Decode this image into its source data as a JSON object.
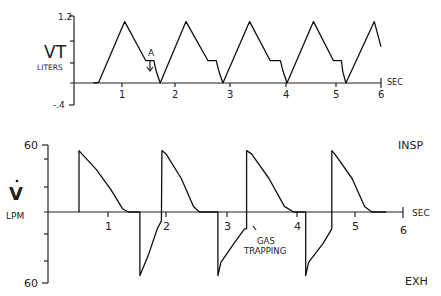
{
  "chart_data": [
    {
      "type": "line",
      "title": "",
      "ylabel_main": "VT",
      "ylabel_unit": "LITERS",
      "xlabel": "SEC",
      "xlim": [
        0,
        6
      ],
      "ylim": [
        -0.4,
        1.2
      ],
      "y_tick_labels": [
        "1.2",
        "-.4"
      ],
      "y_ticks": [
        1.2,
        0.8,
        0.4,
        0,
        -0.4
      ],
      "x_ticks": [
        1,
        2,
        3,
        4,
        5,
        6
      ],
      "x_tick_labels": [
        "1",
        "2",
        "3",
        "4",
        "5",
        "6"
      ],
      "grid": false,
      "annotations": [
        {
          "text": "A",
          "x": 1.55,
          "y": 0.35,
          "arrow": "down"
        }
      ],
      "series": [
        {
          "name": "Tidal volume",
          "x": [
            0.45,
            0.55,
            1.05,
            1.45,
            1.6,
            1.65,
            1.72,
            2.2,
            2.6,
            2.75,
            2.8,
            2.87,
            3.35,
            3.72,
            3.9,
            3.95,
            4.02,
            4.55,
            4.95,
            5.12,
            5.15,
            5.22,
            5.85,
            6.0
          ],
          "y": [
            0,
            0.01,
            1.1,
            0.4,
            0.4,
            0.2,
            0,
            1.1,
            0.4,
            0.4,
            0.2,
            0,
            1.1,
            0.4,
            0.4,
            0.2,
            0,
            1.1,
            0.4,
            0.4,
            0.2,
            0,
            1.1,
            0.65
          ]
        }
      ]
    },
    {
      "type": "line",
      "title": "",
      "ylabel_main": "V̇",
      "ylabel_unit": "LPM",
      "xlabel": "SEC",
      "xlim": [
        0,
        6
      ],
      "ylim": [
        -60,
        60
      ],
      "y_tick_labels": [
        "60",
        "60"
      ],
      "y_ticks": [
        60,
        40,
        20,
        0,
        -20,
        -40,
        -60
      ],
      "x_ticks": [
        1,
        2,
        3,
        4,
        5,
        6
      ],
      "x_tick_labels": [
        "1",
        "2",
        "3",
        "4",
        "5",
        "6"
      ],
      "grid": false,
      "right_labels": {
        "top": "INSP",
        "bottom": "EXH"
      },
      "annotations": [
        {
          "text": "GAS TRAPPING",
          "x": 3.3,
          "y": -12,
          "arrow": "up-left"
        }
      ],
      "series": [
        {
          "name": "Flow",
          "x": [
            0.5,
            0.5,
            0.55,
            0.8,
            1.05,
            1.25,
            1.35,
            1.55,
            1.55,
            1.7,
            1.85,
            1.92,
            1.93,
            2.0,
            2.25,
            2.45,
            2.55,
            2.85,
            2.85,
            2.9,
            3.1,
            3.25,
            3.28,
            3.28,
            3.35,
            3.6,
            3.82,
            3.95,
            4.15,
            4.15,
            4.2,
            4.45,
            4.6,
            4.6,
            4.65,
            4.95,
            5.2,
            5.35,
            5.65
          ],
          "y": [
            0,
            55,
            52,
            38,
            20,
            3,
            0,
            0,
            -57,
            -38,
            -15,
            -8,
            55,
            52,
            30,
            5,
            0,
            0,
            -57,
            -45,
            -28,
            -15,
            -15,
            55,
            52,
            30,
            5,
            0,
            0,
            -57,
            -45,
            -28,
            -15,
            55,
            52,
            30,
            5,
            0,
            0
          ]
        }
      ]
    }
  ]
}
